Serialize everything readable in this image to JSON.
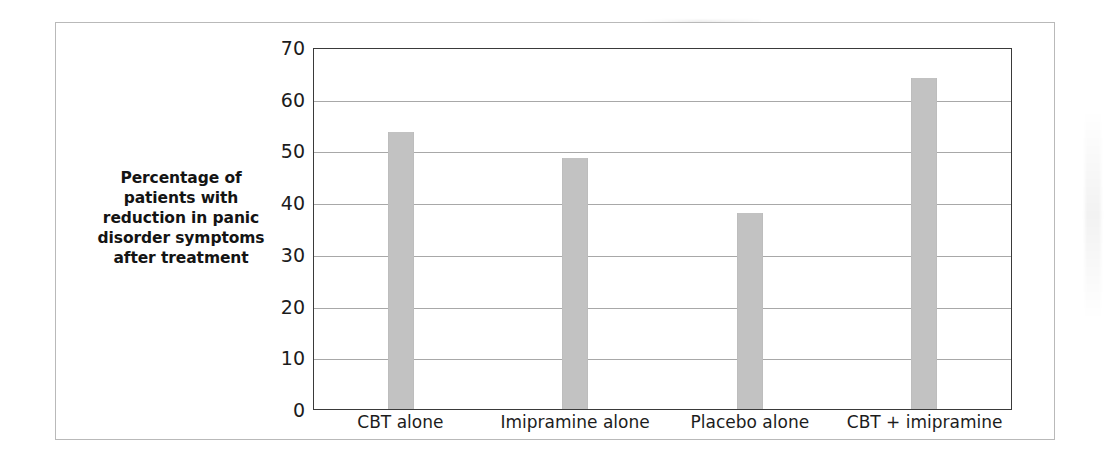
{
  "chart_data": {
    "type": "bar",
    "title": "",
    "xlabel": "",
    "ylabel": "Percentage of patients with reduction in panic disorder symptoms after treatment",
    "categories": [
      "CBT alone",
      "Imipramine alone",
      "Placebo alone",
      "CBT + imipramine"
    ],
    "values": [
      53.5,
      48.5,
      38,
      64
    ],
    "ylim": [
      0,
      70
    ],
    "ytick_labels": [
      "70",
      "60",
      "50",
      "40",
      "30",
      "20",
      "10",
      "0"
    ],
    "ytick_values": [
      70,
      60,
      50,
      40,
      30,
      20,
      10,
      0
    ],
    "grid": true,
    "legend": "none",
    "bar_color": "#c2c2c2",
    "axis_color": "#3a3a3a",
    "gridline_color": "#a8a8a8"
  },
  "axis_title": {
    "line1": "Percentage of",
    "line2": "patients with",
    "line3": "reduction in panic",
    "line4": "disorder symptoms",
    "line5": "after treatment"
  }
}
